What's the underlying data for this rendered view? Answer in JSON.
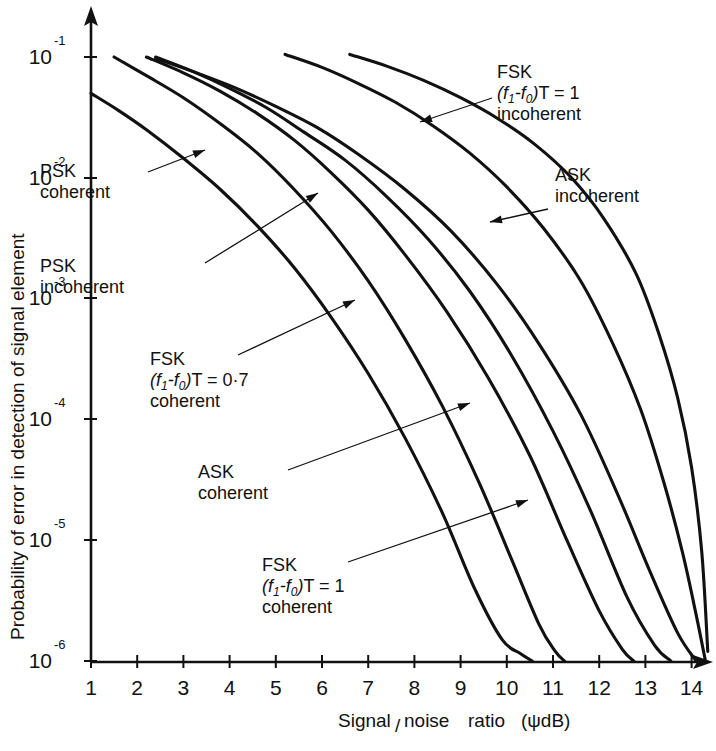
{
  "chart_data": {
    "type": "line",
    "title": "",
    "xlabel": "Signal/noise ratio (ψdB)",
    "ylabel": "Probability of error in detection of signal element",
    "xlim": [
      1,
      14.4
    ],
    "ylim": [
      1e-06,
      0.1
    ],
    "yscale": "log",
    "xscale": "linear",
    "grid": false,
    "legend": "inline-annotations",
    "xticks": [
      1,
      2,
      3,
      4,
      5,
      6,
      7,
      8,
      9,
      10,
      11,
      12,
      13,
      14
    ],
    "xtick_labels": [
      "1",
      "2",
      "3",
      "4",
      "5",
      "6",
      "7",
      "8",
      "9",
      "10",
      "11",
      "12",
      "13",
      "14"
    ],
    "yticks": [
      0.1,
      0.01,
      0.001,
      0.0001,
      1e-05,
      1e-06
    ],
    "ytick_mantissa": [
      "10",
      "10",
      "10",
      "10",
      "10",
      "10"
    ],
    "ytick_exponent": [
      "-1",
      "-2",
      "-3",
      "-4",
      "-5",
      "-6"
    ],
    "series": [
      {
        "name": "PSK coherent",
        "label_lines": [
          "PSK",
          "coherent"
        ],
        "x": [
          1.0,
          1.6,
          2.2,
          3.0,
          3.8,
          4.6,
          5.4,
          6.2,
          7.0,
          7.8,
          8.6,
          9.3,
          9.9,
          10.3,
          10.55
        ],
        "y": [
          0.05,
          0.036,
          0.025,
          0.0145,
          0.008,
          0.004,
          0.0018,
          0.0007,
          0.00024,
          7e-05,
          1.7e-05,
          4e-06,
          1.5e-06,
          1.15e-06,
          1e-06
        ]
      },
      {
        "name": "PSK incoherent",
        "label_lines": [
          "PSK",
          "incoherent"
        ],
        "x": [
          1.5,
          2.2,
          3.0,
          3.8,
          4.6,
          5.4,
          6.2,
          7.0,
          7.8,
          8.6,
          9.4,
          10.1,
          10.7,
          11.05,
          11.25
        ],
        "y": [
          0.1,
          0.07,
          0.046,
          0.028,
          0.016,
          0.008,
          0.0036,
          0.0014,
          0.00046,
          0.00013,
          3e-05,
          7e-06,
          2e-06,
          1.2e-06,
          1e-06
        ]
      },
      {
        "name": "FSK coherent (f1-f0)T = 0.7",
        "label_lines": [
          "FSK",
          "(f1-f0)T = 0·7",
          "coherent"
        ],
        "x": [
          2.2,
          3.0,
          3.8,
          4.6,
          5.4,
          6.2,
          7.0,
          7.8,
          8.7,
          9.6,
          10.5,
          11.3,
          12.0,
          12.5,
          12.75
        ],
        "y": [
          0.1,
          0.074,
          0.052,
          0.034,
          0.0205,
          0.011,
          0.0054,
          0.0023,
          0.00078,
          0.00022,
          5e-05,
          1e-05,
          2.6e-06,
          1.25e-06,
          1e-06
        ]
      },
      {
        "name": "ASK coherent",
        "label_lines": [
          "ASK",
          "coherent"
        ],
        "x": [
          2.4,
          3.2,
          4.0,
          4.8,
          5.6,
          6.5,
          7.4,
          8.3,
          9.2,
          10.1,
          11.0,
          11.8,
          12.6,
          13.2,
          13.55
        ],
        "y": [
          0.1,
          0.076,
          0.055,
          0.038,
          0.024,
          0.014,
          0.007,
          0.0031,
          0.00115,
          0.00034,
          8e-05,
          1.8e-05,
          3.4e-06,
          1.35e-06,
          1e-06
        ]
      },
      {
        "name": "FSK coherent (f1-f0)T = 1",
        "label_lines": [
          "FSK",
          "(f1-f0)T = 1",
          "coherent"
        ],
        "x": [
          2.4,
          3.2,
          4.1,
          5.0,
          5.9,
          6.8,
          7.8,
          8.8,
          9.8,
          10.7,
          11.6,
          12.4,
          13.1,
          13.7,
          14.1
        ],
        "y": [
          0.097,
          0.076,
          0.056,
          0.039,
          0.026,
          0.0155,
          0.008,
          0.0036,
          0.0013,
          0.00042,
          0.00011,
          2.4e-05,
          5.5e-06,
          1.7e-06,
          1e-06
        ]
      },
      {
        "name": "FSK incoherent (f1-f0)T = 1",
        "label_lines": [
          "FSK",
          "(f1-f0)T = 1",
          "incoherent"
        ],
        "x": [
          5.2,
          6.0,
          6.8,
          7.6,
          8.4,
          9.2,
          10.0,
          10.8,
          11.6,
          12.3,
          12.9,
          13.4,
          13.8,
          14.1,
          14.3
        ],
        "y": [
          0.105,
          0.082,
          0.06,
          0.042,
          0.027,
          0.016,
          0.0084,
          0.0038,
          0.0014,
          0.00042,
          0.00012,
          3e-05,
          8e-06,
          2.4e-06,
          1e-06
        ]
      },
      {
        "name": "ASK incoherent",
        "label_lines": [
          "ASK",
          "incoherent"
        ],
        "x": [
          6.6,
          7.4,
          8.2,
          9.0,
          9.8,
          10.6,
          11.4,
          12.1,
          12.8,
          13.3,
          13.7,
          14.0,
          14.22,
          14.35
        ],
        "y": [
          0.105,
          0.084,
          0.064,
          0.046,
          0.031,
          0.019,
          0.01,
          0.0046,
          0.0016,
          0.0005,
          0.00015,
          4e-05,
          8e-06,
          1.2e-06
        ]
      }
    ],
    "annotations": [
      {
        "id": "psk-coherent",
        "lines": [
          "PSK",
          "coherent"
        ],
        "text_x": 40,
        "text_y": 177,
        "leader": [
          [
            148,
            172
          ],
          [
            205,
            150
          ]
        ]
      },
      {
        "id": "psk-incoherent",
        "lines": [
          "PSK",
          "incoherent"
        ],
        "text_x": 40,
        "text_y": 272,
        "leader": [
          [
            205,
            263
          ],
          [
            318,
            193
          ]
        ]
      },
      {
        "id": "fsk-coh-07",
        "lines": [
          "FSK",
          "(f1-f0)T = 0·7",
          "coherent"
        ],
        "text_x": 150,
        "text_y": 365,
        "leader": [
          [
            238,
            355
          ],
          [
            355,
            300
          ]
        ]
      },
      {
        "id": "ask-coherent",
        "lines": [
          "ASK",
          "coherent"
        ],
        "text_x": 198,
        "text_y": 478,
        "leader": [
          [
            288,
            470
          ],
          [
            470,
            403
          ]
        ]
      },
      {
        "id": "fsk-coh-1",
        "lines": [
          "FSK",
          "(f1-f0)T = 1",
          "coherent"
        ],
        "text_x": 262,
        "text_y": 571,
        "leader": [
          [
            348,
            562
          ],
          [
            528,
            500
          ]
        ]
      },
      {
        "id": "fsk-incoh-1",
        "lines": [
          "FSK",
          "(f1-f0)T = 1",
          "incoherent"
        ],
        "text_x": 497,
        "text_y": 78,
        "leader": [
          [
            492,
            98
          ],
          [
            420,
            122
          ]
        ]
      },
      {
        "id": "ask-incoherent",
        "lines": [
          "ASK",
          "incoherent"
        ],
        "text_x": 555,
        "text_y": 181,
        "leader": [
          [
            548,
            209
          ],
          [
            490,
            222
          ]
        ]
      }
    ]
  },
  "axis": {
    "y_title": "Probability of error in detection of signal element",
    "x_title_parts": {
      "p1": "Signal",
      "slash": "/",
      "p2": "noise",
      "p3": "ratio",
      "p4": "(ψdB)"
    },
    "x_title_full": "Signal/noise ratio (ψdB)"
  }
}
